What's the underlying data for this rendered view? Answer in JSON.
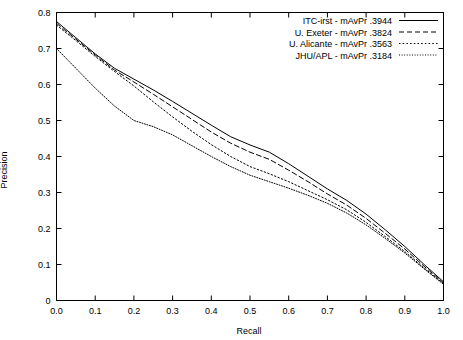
{
  "chart_data": {
    "type": "line",
    "title": "",
    "xlabel": "Recall",
    "ylabel": "Precision",
    "xlim": [
      0.0,
      1.0
    ],
    "ylim": [
      0.0,
      0.8
    ],
    "xticks": [
      "0.0",
      "0.1",
      "0.2",
      "0.3",
      "0.4",
      "0.5",
      "0.6",
      "0.7",
      "0.8",
      "0.9",
      "1.0"
    ],
    "yticks": [
      "0",
      "0.1",
      "0.2",
      "0.3",
      "0.4",
      "0.5",
      "0.6",
      "0.7",
      "0.8"
    ],
    "xtick_values": [
      0.0,
      0.1,
      0.2,
      0.3,
      0.4,
      0.5,
      0.6,
      0.7,
      0.8,
      0.9,
      1.0
    ],
    "ytick_values": [
      0.0,
      0.1,
      0.2,
      0.3,
      0.4,
      0.5,
      0.6,
      0.7,
      0.8
    ],
    "grid": false,
    "legend_position": "top-right",
    "x": [
      0.0,
      0.05,
      0.1,
      0.15,
      0.2,
      0.25,
      0.3,
      0.35,
      0.4,
      0.45,
      0.5,
      0.55,
      0.6,
      0.65,
      0.7,
      0.75,
      0.8,
      0.85,
      0.9,
      0.95,
      1.0
    ],
    "series": [
      {
        "name": "ITC-irst - mAvPr .3944",
        "label": "ITC-irst",
        "metric_name": "mAvPr",
        "metric_value": ".3944",
        "style": "solid",
        "color": "#000000",
        "values": [
          0.775,
          0.73,
          0.685,
          0.645,
          0.615,
          0.585,
          0.553,
          0.52,
          0.487,
          0.455,
          0.432,
          0.412,
          0.38,
          0.345,
          0.31,
          0.278,
          0.24,
          0.196,
          0.15,
          0.1,
          0.052
        ]
      },
      {
        "name": "U. Exeter - mAvPr .3824",
        "label": "U. Exeter",
        "metric_name": "mAvPr",
        "metric_value": ".3824",
        "style": "dashed",
        "color": "#000000",
        "values": [
          0.77,
          0.726,
          0.682,
          0.64,
          0.607,
          0.573,
          0.538,
          0.503,
          0.468,
          0.437,
          0.412,
          0.392,
          0.362,
          0.33,
          0.296,
          0.265,
          0.228,
          0.186,
          0.143,
          0.095,
          0.049
        ]
      },
      {
        "name": "U. Alicante - mAvPr .3563",
        "label": "U. Alicante",
        "metric_name": "mAvPr",
        "metric_value": ".3563",
        "style": "dotted",
        "color": "#000000",
        "values": [
          0.765,
          0.722,
          0.678,
          0.636,
          0.596,
          0.552,
          0.51,
          0.47,
          0.433,
          0.4,
          0.372,
          0.352,
          0.33,
          0.305,
          0.28,
          0.252,
          0.217,
          0.177,
          0.136,
          0.09,
          0.047
        ]
      },
      {
        "name": "JHU/APL - mAvPr .3184",
        "label": "JHU/APL",
        "metric_name": "mAvPr",
        "metric_value": ".3184",
        "style": "dashdot",
        "color": "#000000",
        "values": [
          0.7,
          0.645,
          0.59,
          0.54,
          0.5,
          0.483,
          0.46,
          0.43,
          0.4,
          0.372,
          0.348,
          0.33,
          0.312,
          0.292,
          0.27,
          0.243,
          0.21,
          0.172,
          0.132,
          0.088,
          0.045
        ]
      }
    ]
  }
}
